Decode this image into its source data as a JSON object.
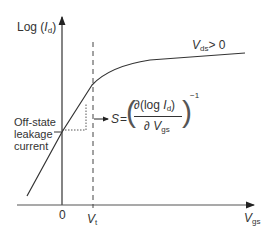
{
  "diagram": {
    "y_axis_label": {
      "prefix": "Log (",
      "var": "I",
      "sub": "d",
      "suffix": ")"
    },
    "x_axis_label": {
      "var": "V",
      "sub": "gs"
    },
    "curve_label": {
      "var": "V",
      "sub": "ds",
      "suffix": "> 0"
    },
    "origin_label": "0",
    "threshold_label": {
      "var": "V",
      "sub": "t"
    },
    "leakage_label": [
      "Off-state",
      "leakage",
      "current"
    ],
    "formula": {
      "lhs": "S",
      "equals": "=",
      "numerator": {
        "partial": "∂",
        "open": "(",
        "log": "log ",
        "var": "I",
        "sub": "d",
        "close": ")"
      },
      "denominator": {
        "partial": "∂",
        "var": "V",
        "sub": "gs"
      },
      "exponent": "−1"
    },
    "colors": {
      "line": "#333333",
      "text": "#333333"
    }
  }
}
